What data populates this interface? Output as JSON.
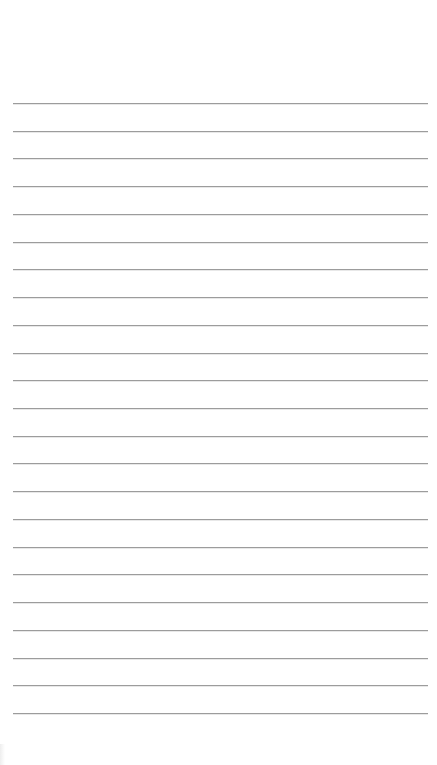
{
  "page": {
    "type": "lined-paper",
    "background_color": "#ffffff",
    "rule_color": "#9c9c9c",
    "rule_count": 23,
    "rule_left_px": 13,
    "rule_right_px": 428,
    "first_rule_y_px": 103,
    "last_rule_y_px": 713,
    "rule_spacing_px": 27.7
  }
}
